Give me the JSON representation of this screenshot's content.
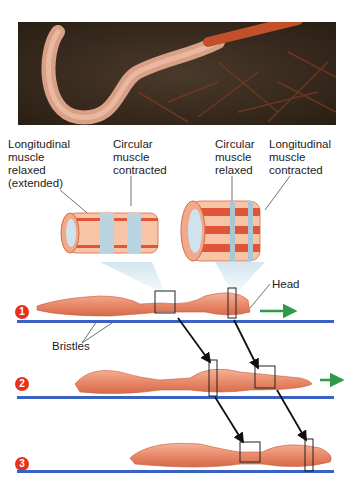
{
  "photo": {
    "subject": "earthworm-on-soil-photo"
  },
  "labels": {
    "long_relaxed": [
      "Longitudinal",
      "muscle",
      "relaxed",
      "(extended)"
    ],
    "circ_contracted": [
      "Circular",
      "muscle",
      "contracted"
    ],
    "circ_relaxed": [
      "Circular",
      "muscle",
      "relaxed"
    ],
    "long_contracted": [
      "Longitudinal",
      "muscle",
      "contracted"
    ],
    "head": "Head",
    "bristles": "Bristles"
  },
  "steps": [
    {
      "number": "1"
    },
    {
      "number": "2"
    },
    {
      "number": "3"
    }
  ],
  "colors": {
    "ground_line": "#3a62c4",
    "step_badge": "#e8301f",
    "motion_arrow": "#2e9a4a",
    "worm_body": "#e98a6a",
    "muscle_band": "#b9d4e0"
  }
}
